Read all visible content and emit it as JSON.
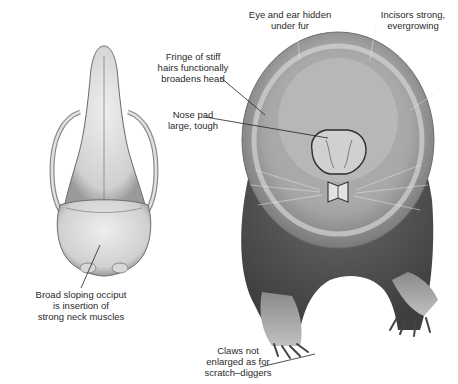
{
  "figure": {
    "labels": {
      "eye_ear": "Eye and ear hidden\nunder fur",
      "incisors": "Incisors strong,\nevergrowing",
      "fringe": "Fringe of stiff\nhairs functionally\nbroadens head",
      "nose_pad": "Nose pad\nlarge, tough",
      "occiput": "Broad sloping occiput\nis insertion of\nstrong neck muscles",
      "claws": "Claws not\nenlarged as for\nscratch–diggers"
    },
    "colors": {
      "bone_light": "#e6e6e6",
      "bone_shade": "#9a9a9a",
      "fur_light": "#bdbdbd",
      "fur_mid": "#8a8a8a",
      "fur_dark": "#4a4a4a",
      "leader_line": "#222222"
    }
  }
}
